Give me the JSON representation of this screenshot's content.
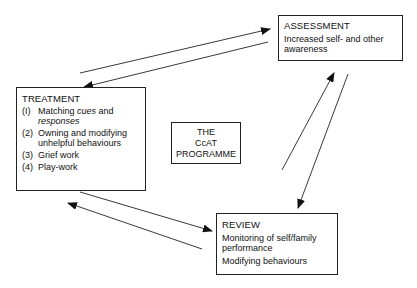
{
  "diagram": {
    "center": {
      "lines": [
        "THE",
        "CcAT",
        "PROGRAMME"
      ]
    },
    "assessment": {
      "title": "ASSESSMENT",
      "body": [
        "Increased self- and other",
        "awareness"
      ]
    },
    "treatment": {
      "title": "TREATMENT",
      "items": [
        {
          "num": "(I)",
          "text_before": "Matching ",
          "text_em1": "cues",
          "text_mid": " and",
          "text_em2": "responses"
        },
        {
          "num": "(2)",
          "text": "Owning and modifying",
          "text2": "unhelpful behaviours"
        },
        {
          "num": "(3)",
          "text": "Grief work"
        },
        {
          "num": "(4)",
          "text": "Play-work"
        }
      ]
    },
    "review": {
      "title": "REVIEW",
      "body": [
        "Monitoring of self/family",
        "performance",
        "Modifying behaviours"
      ]
    },
    "edges": [
      {
        "from": "TREATMENT",
        "to": "ASSESSMENT"
      },
      {
        "from": "ASSESSMENT",
        "to": "TREATMENT"
      },
      {
        "from": "REVIEW",
        "to": "ASSESSMENT"
      },
      {
        "from": "ASSESSMENT",
        "to": "REVIEW"
      },
      {
        "from": "TREATMENT",
        "to": "REVIEW"
      },
      {
        "from": "REVIEW",
        "to": "TREATMENT"
      }
    ],
    "colors": {
      "stroke": "#222222",
      "background": "#ffffff"
    }
  }
}
